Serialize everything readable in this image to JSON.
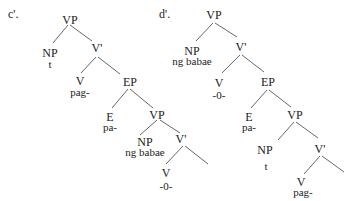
{
  "diagram": {
    "type": "syntax-trees",
    "trees": [
      {
        "label": "c'.",
        "nodes": {
          "vp1": {
            "cat": "VP"
          },
          "np1": {
            "cat": "NP",
            "word": "t"
          },
          "vbar1": {
            "cat": "V'"
          },
          "v1": {
            "cat": "V",
            "word": "pag-"
          },
          "ep": {
            "cat": "EP"
          },
          "e": {
            "cat": "E",
            "word": "pa-"
          },
          "vp2": {
            "cat": "VP"
          },
          "np2": {
            "cat": "NP",
            "word": "ng babae"
          },
          "vbar2": {
            "cat": "V'"
          },
          "v2": {
            "cat": "V",
            "word": "-0-"
          }
        }
      },
      {
        "label": "d'.",
        "nodes": {
          "vp1": {
            "cat": "VP"
          },
          "np1": {
            "cat": "NP",
            "word": "ng babae"
          },
          "vbar1": {
            "cat": "V'"
          },
          "v1": {
            "cat": "V",
            "word": "-0-"
          },
          "ep": {
            "cat": "EP"
          },
          "e": {
            "cat": "E",
            "word": "pa-"
          },
          "vp2": {
            "cat": "VP"
          },
          "np2": {
            "cat": "NP",
            "word": "t"
          },
          "vbar2": {
            "cat": "V'"
          },
          "v2": {
            "cat": "V",
            "word": "pag-"
          }
        }
      }
    ]
  }
}
